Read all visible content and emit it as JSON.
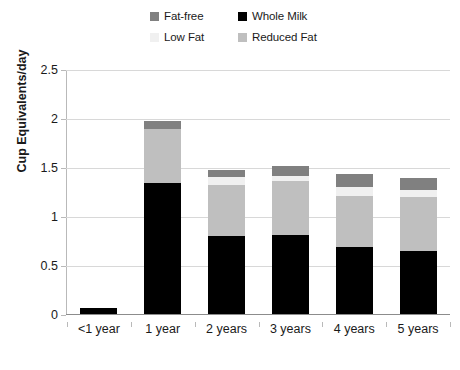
{
  "chart_data": {
    "type": "bar",
    "barmode": "stacked",
    "title": "",
    "xlabel": "",
    "ylabel": "Cup Equivalents/day",
    "ylim": [
      0,
      2.5
    ],
    "ytick_labels": [
      "0",
      "0.5",
      "1",
      "1.5",
      "2",
      "2.5"
    ],
    "ytick_values": [
      0,
      0.5,
      1,
      1.5,
      2,
      2.5
    ],
    "grid": true,
    "legend_position": "top-center",
    "categories": [
      "<1 year",
      "1 year",
      "2 years",
      "3 years",
      "4 years",
      "5 years"
    ],
    "series": [
      {
        "name": "Whole Milk",
        "color": "#000000",
        "values": [
          0.07,
          1.35,
          0.81,
          0.82,
          0.69,
          0.65
        ]
      },
      {
        "name": "Reduced Fat",
        "color": "#bfbfbf",
        "values": [
          0.0,
          0.55,
          0.52,
          0.55,
          0.52,
          0.55
        ]
      },
      {
        "name": "Low Fat",
        "color": "#f0f0f0",
        "values": [
          0.0,
          0.0,
          0.08,
          0.05,
          0.1,
          0.08
        ]
      },
      {
        "name": "Fat-free",
        "color": "#808080",
        "values": [
          0.0,
          0.08,
          0.07,
          0.1,
          0.13,
          0.12
        ]
      }
    ],
    "totals": [
      0.07,
      1.98,
      1.48,
      1.52,
      1.44,
      1.4
    ]
  },
  "legend": {
    "entries": [
      {
        "label": "Fat-free",
        "color": "#808080"
      },
      {
        "label": "Whole Milk",
        "color": "#000000"
      },
      {
        "label": "Low Fat",
        "color": "#f0f0f0"
      },
      {
        "label": "Reduced Fat",
        "color": "#bfbfbf"
      }
    ]
  },
  "axis": {
    "y_title": "Cup Equivalents/day"
  }
}
